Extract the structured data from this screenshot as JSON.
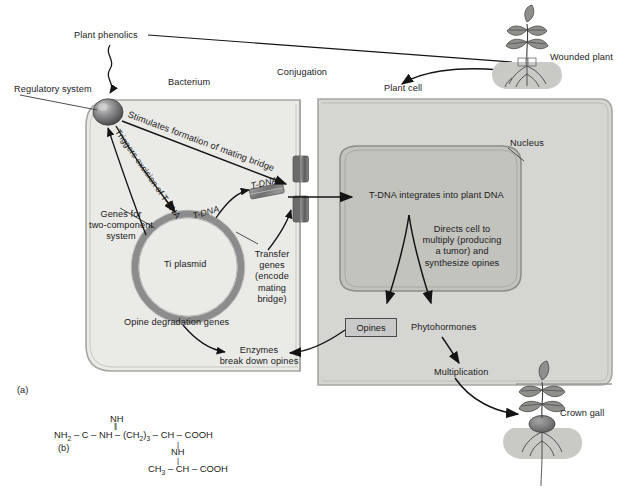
{
  "figure": {
    "panel_a_tag": "(a)",
    "panel_b_tag": "(b)"
  },
  "labels": {
    "plant_phenolics": "Plant phenolics",
    "regulatory_system": "Regulatory system",
    "bacterium": "Bacterium",
    "conjugation": "Conjugation",
    "plant_cell": "Plant cell",
    "wounded_plant": "Wounded plant",
    "nucleus": "Nucleus",
    "stimulates_bridge": "Stimulates formation of mating bridge",
    "triggers_excision": "Triggers excision of T-DNA",
    "t_dna_plasmid": "T-DNA",
    "t_dna_bridge": "T-DNA",
    "genes_two_component": "Genes for\ntwo-component\nsystem",
    "ti_plasmid": "Ti plasmid",
    "transfer_genes": "Transfer\ngenes\n(encode\nmating\nbridge)",
    "opine_degradation_genes": "Opine degradation genes",
    "enzymes_break_down": "Enzymes\nbreak down opines",
    "t_dna_integrates": "T-DNA integrates into plant DNA",
    "directs_cell": "Directs cell to\nmultiply (producing\na tumor) and\nsynthesize opines",
    "opines": "Opines",
    "phytohormones": "Phytohormones",
    "multiplication": "Multiplication",
    "crown_gall": "Crown gall"
  },
  "formula": {
    "line1_nh": "NH",
    "line2_bond": "||",
    "line3_main_pre": "NH",
    "line3_main_pre_sub": "2",
    "line3_main_a": " – C – NH – (CH",
    "line3_main_a_sub": "2",
    "line3_main_b": ")",
    "line3_main_b_sub": "3",
    "line3_main_c": " – CH – COOH",
    "line4_nh": "NH",
    "line5_bond": "|",
    "line6_pre": "CH",
    "line6_pre_sub": "3",
    "line6_rest": " – CH – COOH"
  },
  "colors": {
    "bacterium_fill": "#e9e9e6",
    "bacterium_stroke": "#a8a8a4",
    "plant_cell_fill": "#d4d4d0",
    "plant_cell_stroke": "#a8a8a4",
    "nucleus_fill": "#c2c2bd",
    "nucleus_stroke": "#8f8f8b",
    "plasmid_ring": "#8c8c8c",
    "bridge_dark": "#6e6e6e",
    "bridge_mid": "#909090",
    "opines_box_fill": "#c9c9c9",
    "soil_fill": "#c8c8c4",
    "text": "#1a1a1a",
    "arrow": "#141414"
  }
}
